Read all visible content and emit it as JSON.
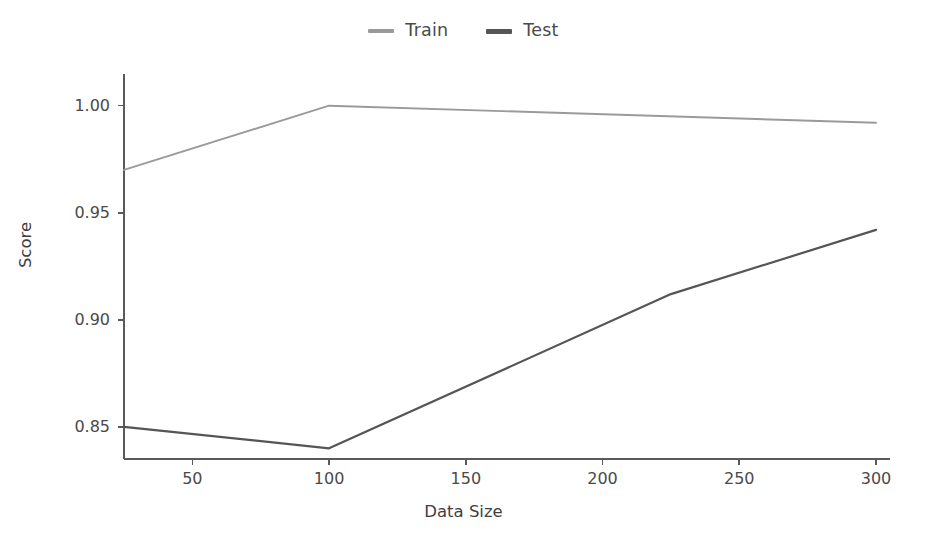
{
  "chart_data": {
    "type": "line",
    "title": "",
    "xlabel": "Data Size",
    "ylabel": "Score",
    "xlim": [
      25,
      300
    ],
    "ylim": [
      0.835,
      1.012
    ],
    "xticks": [
      50,
      100,
      150,
      200,
      250,
      300
    ],
    "xtick_labels": [
      "50",
      "100",
      "150",
      "200",
      "250",
      "300"
    ],
    "yticks": [
      0.85,
      0.9,
      0.95,
      1.0
    ],
    "ytick_labels": [
      "0.85",
      "0.90",
      "0.95",
      "1.00"
    ],
    "grid": false,
    "legend_position": "top-center",
    "x": [
      25,
      100,
      225,
      300
    ],
    "series": [
      {
        "name": "Train",
        "color": "#9a9a9a",
        "x": [
          25,
          100,
          300
        ],
        "values": [
          0.97,
          1.0,
          0.992
        ]
      },
      {
        "name": "Test",
        "color": "#555555",
        "x": [
          25,
          100,
          225,
          300
        ],
        "values": [
          0.85,
          0.84,
          0.912,
          0.942
        ]
      }
    ]
  },
  "legend": {
    "entries": [
      {
        "label": "Train",
        "swatch_name": "legend-swatch-train"
      },
      {
        "label": "Test",
        "swatch_name": "legend-swatch-test"
      }
    ]
  },
  "axes": {
    "x_title": "Data Size",
    "y_title": "Score",
    "x_tick_labels": [
      "50",
      "100",
      "150",
      "200",
      "250",
      "300"
    ],
    "y_tick_labels": [
      "0.85",
      "0.90",
      "0.95",
      "1.00"
    ]
  },
  "colors": {
    "background": "#ffffff",
    "axis": "#5a5a5a",
    "text": "#4a4a4a",
    "train": "#9a9a9a",
    "test": "#555555"
  }
}
